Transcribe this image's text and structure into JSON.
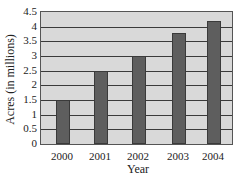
{
  "chart_data": {
    "type": "bar",
    "title": "",
    "xlabel": "Year",
    "ylabel": "Acres (in millions)",
    "categories": [
      "2000",
      "2001",
      "2002",
      "2003",
      "2004"
    ],
    "values": [
      1.5,
      2.5,
      3.0,
      3.8,
      4.2
    ],
    "ylim": [
      0,
      4.5
    ],
    "yticks": [
      "0",
      "0.5",
      "1",
      "1.5",
      "2",
      "2.5",
      "3",
      "3.5",
      "4",
      "4.5"
    ],
    "grid": true,
    "legend": null,
    "colors": {
      "bar": "#5e5e5e",
      "plot_background": "#d9d9d9",
      "gridline": "#3a3a3a"
    }
  }
}
